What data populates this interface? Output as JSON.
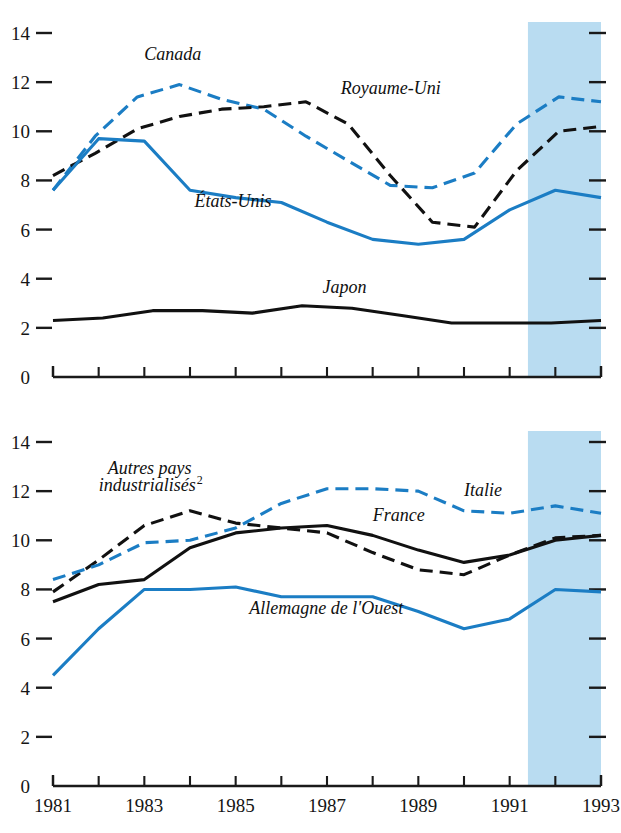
{
  "figure": {
    "background_color": "#ffffff",
    "forecast_band_color": "#b9dcf1",
    "blue_series_color": "#1b7dc4",
    "black_series_color": "#111111"
  },
  "axes": {
    "y_ticks": [
      "0",
      "2",
      "4",
      "6",
      "8",
      "10",
      "12",
      "14"
    ],
    "y_min": 0,
    "y_max": 14,
    "x_ticks": [
      "1981",
      "1982",
      "1983",
      "1984",
      "1985",
      "1986",
      "1987",
      "1988",
      "1989",
      "1990",
      "1991",
      "1992",
      "1993"
    ],
    "x_tick_labels_shown": [
      "1981",
      "1983",
      "1985",
      "1987",
      "1989",
      "1991",
      "1993"
    ],
    "x_min": 1981,
    "x_max": 1993
  },
  "chart_data": [
    {
      "type": "line",
      "panel": "top",
      "title": "",
      "xlabel": "",
      "ylabel": "",
      "ylim": [
        0,
        14
      ],
      "xlim": [
        1981,
        1993
      ],
      "grid": false,
      "legend_position": "inline-annotations",
      "x": [
        1981,
        1982,
        1983,
        1984,
        1985,
        1986,
        1987,
        1988,
        1989,
        1990,
        1991,
        1992,
        1993
      ],
      "annotations": [
        {
          "text": "Canada",
          "x": 1983.0,
          "y": 12.9
        },
        {
          "text": "Royaume-Uni",
          "x": 1987.3,
          "y": 11.5
        },
        {
          "text": "États-Unis",
          "x": 1984.1,
          "y": 6.9
        },
        {
          "text": "Japon",
          "x": 1986.9,
          "y": 3.4
        }
      ],
      "shaded_region": {
        "from": 1991.4,
        "to": 1993.0,
        "label": "projection"
      },
      "series": [
        {
          "name": "Canada",
          "color": "#1b7dc4",
          "style": "dashed",
          "values": [
            7.6,
            9.8,
            11.4,
            11.9,
            11.3,
            10.9,
            9.8,
            8.8,
            7.8,
            7.7,
            8.3,
            10.3,
            11.4,
            11.2
          ]
        },
        {
          "name": "Royaume-Uni",
          "color": "#111111",
          "style": "dashed",
          "values": [
            8.2,
            9.1,
            10.1,
            10.6,
            10.9,
            11.0,
            11.2,
            10.3,
            8.2,
            6.3,
            6.1,
            8.4,
            10.0,
            10.2
          ]
        },
        {
          "name": "États-Unis",
          "color": "#1b7dc4",
          "style": "solid",
          "values": [
            7.6,
            9.7,
            9.6,
            7.6,
            7.3,
            7.1,
            6.3,
            5.6,
            5.4,
            5.6,
            6.8,
            7.6,
            7.3
          ]
        },
        {
          "name": "Japon",
          "color": "#111111",
          "style": "solid",
          "values": [
            2.3,
            2.4,
            2.7,
            2.7,
            2.6,
            2.9,
            2.8,
            2.5,
            2.2,
            2.2,
            2.2,
            2.3
          ]
        }
      ]
    },
    {
      "type": "line",
      "panel": "bottom",
      "title": "",
      "xlabel": "",
      "ylabel": "",
      "ylim": [
        0,
        14
      ],
      "xlim": [
        1981,
        1993
      ],
      "grid": false,
      "legend_position": "inline-annotations",
      "x": [
        1981,
        1982,
        1983,
        1984,
        1985,
        1986,
        1987,
        1988,
        1989,
        1990,
        1991,
        1992,
        1993
      ],
      "annotations": [
        {
          "text": "Autres pays",
          "x": 1982.2,
          "y": 12.7
        },
        {
          "text": "industrialisés",
          "x": 1982.0,
          "y": 12.0,
          "superscript": "2"
        },
        {
          "text": "Italie",
          "x": 1990.0,
          "y": 11.8
        },
        {
          "text": "France",
          "x": 1988.0,
          "y": 10.8
        },
        {
          "text": "Allemagne de l'Ouest",
          "x": 1985.3,
          "y": 7.0
        }
      ],
      "shaded_region": {
        "from": 1991.4,
        "to": 1993.0,
        "label": "projection"
      },
      "series": [
        {
          "name": "Autres pays industrialisés",
          "color": "#111111",
          "style": "dashed",
          "values": [
            7.9,
            9.2,
            10.6,
            11.2,
            10.7,
            10.5,
            10.3,
            9.5,
            8.8,
            8.6,
            9.4,
            10.1,
            10.2
          ]
        },
        {
          "name": "Italie",
          "color": "#1b7dc4",
          "style": "dashed",
          "values": [
            8.4,
            9.0,
            9.9,
            10.0,
            10.5,
            11.5,
            12.1,
            12.1,
            12.0,
            11.2,
            11.1,
            11.4,
            11.1
          ]
        },
        {
          "name": "France",
          "color": "#111111",
          "style": "solid",
          "values": [
            7.5,
            8.2,
            8.4,
            9.7,
            10.3,
            10.5,
            10.6,
            10.2,
            9.6,
            9.1,
            9.4,
            10.0,
            10.2
          ]
        },
        {
          "name": "Allemagne de l'Ouest",
          "color": "#1b7dc4",
          "style": "solid",
          "values": [
            4.5,
            6.4,
            8.0,
            8.0,
            8.1,
            7.7,
            7.7,
            7.7,
            7.1,
            6.4,
            6.8,
            8.0,
            7.9
          ]
        }
      ]
    }
  ]
}
